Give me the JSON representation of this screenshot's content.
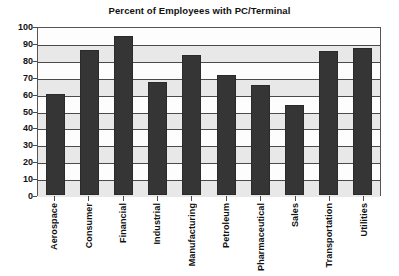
{
  "chart_data": {
    "type": "bar",
    "title": "Percent of Employees with PC/Terminal",
    "xlabel": "",
    "ylabel": "",
    "ylim": [
      0,
      100
    ],
    "ytick_step": 10,
    "yticks": [
      100,
      90,
      80,
      70,
      60,
      50,
      40,
      30,
      20,
      10,
      0
    ],
    "grid": true,
    "legend": false,
    "bar_color": "#353535",
    "plot_background": "#fdfdfd",
    "gridline_color": "#4a4a4a",
    "categories": [
      "Aerospace",
      "Consumer",
      "Financial",
      "Industrial",
      "Manufacturing",
      "Petroleum",
      "Pharmaceutical",
      "Sales",
      "Transportation",
      "Utilities"
    ],
    "values": [
      60,
      86,
      94,
      67,
      83,
      71,
      65,
      53,
      85,
      87
    ]
  }
}
